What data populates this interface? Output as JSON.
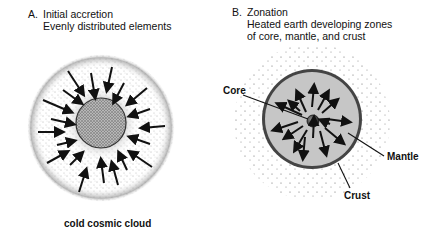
{
  "panel_a": {
    "letter": "A.",
    "title": "Initial accretion",
    "subtitle": "Evenly distributed elements",
    "caption": "cold cosmic cloud"
  },
  "panel_b": {
    "letter": "B.",
    "title": "Zonation",
    "subtitle_line1": "Heated earth developing zones",
    "subtitle_line2": "of core, mantle, and crust",
    "labels": {
      "core": "Core",
      "mantle": "Mantle",
      "crust": "Crust"
    }
  },
  "colors": {
    "ink": "#111111",
    "stipple": "#555555",
    "core_fill_a": "#a8a8a8",
    "mantle_fill": "#c4c4c4",
    "crust_ring": "#444444",
    "core_ball": "#333333"
  }
}
